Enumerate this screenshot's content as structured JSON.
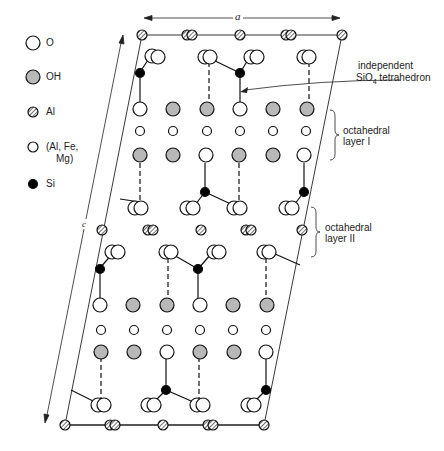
{
  "legend": {
    "items": [
      {
        "symbol": "open-large-circle",
        "label": "O"
      },
      {
        "symbol": "gray-large-circle",
        "label": "OH"
      },
      {
        "symbol": "hatched-circle",
        "label": "Al"
      },
      {
        "symbol": "open-small-circle",
        "label_line1": "(Al, Fe,",
        "label_line2": "Mg)"
      },
      {
        "symbol": "black-small-circle",
        "label": "Si"
      }
    ]
  },
  "axes": {
    "a_label": "a",
    "c_label": "c"
  },
  "annotations": {
    "tetrahedron_line1": "independent",
    "tetrahedron_line2_prefix": "SiO",
    "tetrahedron_line2_subscript": "4",
    "tetrahedron_line2_suffix": " tetrahedron",
    "octa1_line1": "octahedral",
    "octa1_line2": "layer I",
    "octa2_line1": "octahedral",
    "octa2_line2": "layer II"
  },
  "colors": {
    "gray_fill": "#b8b8b8",
    "stroke": "#111111",
    "si_fill": "#000000"
  }
}
